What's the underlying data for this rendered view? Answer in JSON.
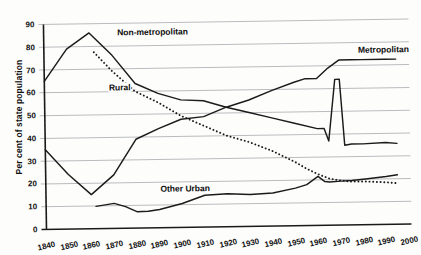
{
  "chart_data": {
    "type": "line",
    "title": "",
    "xlabel": "",
    "ylabel": "Per cent of state population",
    "xlim": [
      1840,
      2000
    ],
    "ylim": [
      0,
      90
    ],
    "grid": true,
    "legend_position": "inline-labels",
    "x_ticks": [
      1840,
      1850,
      1860,
      1870,
      1880,
      1890,
      1900,
      1910,
      1920,
      1930,
      1940,
      1950,
      1960,
      1970,
      1980,
      1990,
      2000
    ],
    "y_ticks": [
      0,
      10,
      20,
      30,
      40,
      50,
      60,
      70,
      80,
      90
    ],
    "series": [
      {
        "name": "Non-metropolitan",
        "style": "solid",
        "label_x": 1872,
        "label_y": 86,
        "x": [
          1840,
          1850,
          1860,
          1870,
          1880,
          1890,
          1900,
          1910,
          1920,
          1930,
          1940,
          1950,
          1960,
          1963,
          1965,
          1968,
          1970,
          1972,
          1975,
          1980,
          1990,
          1995
        ],
        "y": [
          65,
          79,
          86,
          76,
          63.5,
          59,
          56,
          55.5,
          52.5,
          50,
          47.5,
          45,
          42.5,
          42.5,
          37,
          64,
          64,
          35,
          35.5,
          35.5,
          36,
          35.5
        ]
      },
      {
        "name": "Metropolitan",
        "style": "solid",
        "label_x": 1978,
        "label_y": 77,
        "x": [
          1840,
          1850,
          1860,
          1870,
          1880,
          1890,
          1900,
          1910,
          1920,
          1930,
          1940,
          1950,
          1955,
          1960,
          1965,
          1970,
          1975,
          1980,
          1990,
          1995
        ],
        "y": [
          35,
          24,
          15,
          23.5,
          39,
          43.5,
          47.5,
          48.5,
          52.5,
          55.5,
          59.5,
          63,
          64.5,
          64.5,
          69,
          72.5,
          72.5,
          72.5,
          72.5,
          72.5
        ]
      },
      {
        "name": "Rural",
        "style": "dotted",
        "label_x": 1868,
        "label_y": 62,
        "x": [
          1862,
          1870,
          1880,
          1890,
          1900,
          1910,
          1920,
          1930,
          1940,
          1950,
          1955,
          1960,
          1965,
          1970,
          1975,
          1980,
          1990,
          1995
        ],
        "y": [
          77.5,
          69,
          60,
          55,
          49,
          44.5,
          40,
          37,
          33,
          28,
          25,
          22.5,
          20.5,
          19.5,
          19,
          19,
          18.5,
          18
        ]
      },
      {
        "name": "Other Urban",
        "style": "solid",
        "label_x": 1890,
        "label_y": 17,
        "x": [
          1862,
          1870,
          1875,
          1880,
          1885,
          1890,
          1900,
          1910,
          1920,
          1930,
          1940,
          1950,
          1955,
          1960,
          1963,
          1965,
          1970,
          1975,
          1980,
          1990,
          1995
        ],
        "y": [
          9.8,
          11,
          9.5,
          7.2,
          7.3,
          8,
          10.5,
          14,
          14.5,
          14,
          14.5,
          16.5,
          18,
          21.5,
          19.2,
          19,
          19.3,
          19.5,
          20,
          21,
          21.7
        ]
      }
    ]
  }
}
